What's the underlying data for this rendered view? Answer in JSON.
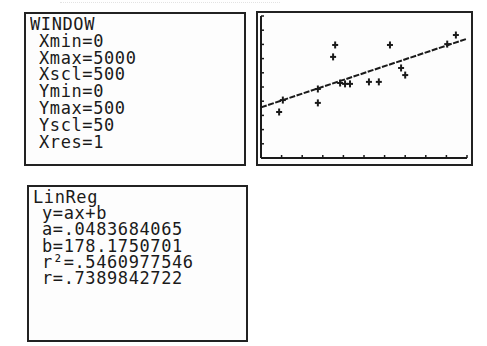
{
  "window_screen": {
    "title": "WINDOW",
    "params": [
      {
        "label": "Xmin=0"
      },
      {
        "label": "Xmax=5000"
      },
      {
        "label": "Xscl=500"
      },
      {
        "label": "Ymin=0"
      },
      {
        "label": "Ymax=500"
      },
      {
        "label": "Yscl=50"
      },
      {
        "label": "Xres=1"
      }
    ]
  },
  "linreg_screen": {
    "title": "LinReg",
    "lines": [
      {
        "text": "y=ax+b"
      },
      {
        "text": "a=.0483684065"
      },
      {
        "text": "b=178.1750701"
      },
      {
        "text": "r²=.5460977546"
      },
      {
        "text": "r=.7389842722"
      }
    ]
  },
  "colors": {
    "ink": "#1a1a1a",
    "screen_bg": "#fdfdfd",
    "page_bg": "#ffffff"
  },
  "chart_data": {
    "type": "scatter",
    "title": "",
    "xlabel": "",
    "ylabel": "",
    "xlim": [
      0,
      5000
    ],
    "ylim": [
      0,
      500
    ],
    "xscl": 500,
    "yscl": 50,
    "grid": false,
    "series": [
      {
        "name": "data",
        "marker": "+",
        "x": [
          440,
          530,
          1380,
          1380,
          1750,
          1800,
          1920,
          2040,
          2160,
          2620,
          2860,
          3130,
          3400,
          3500,
          4520,
          4730
        ],
        "y": [
          162,
          204,
          194,
          243,
          356,
          398,
          264,
          261,
          261,
          268,
          268,
          398,
          317,
          292,
          401,
          433
        ]
      }
    ],
    "regression": {
      "type": "linear",
      "a": 0.0483684065,
      "b": 178.1750701,
      "r2": 0.5460977546,
      "r": 0.7389842722
    }
  }
}
